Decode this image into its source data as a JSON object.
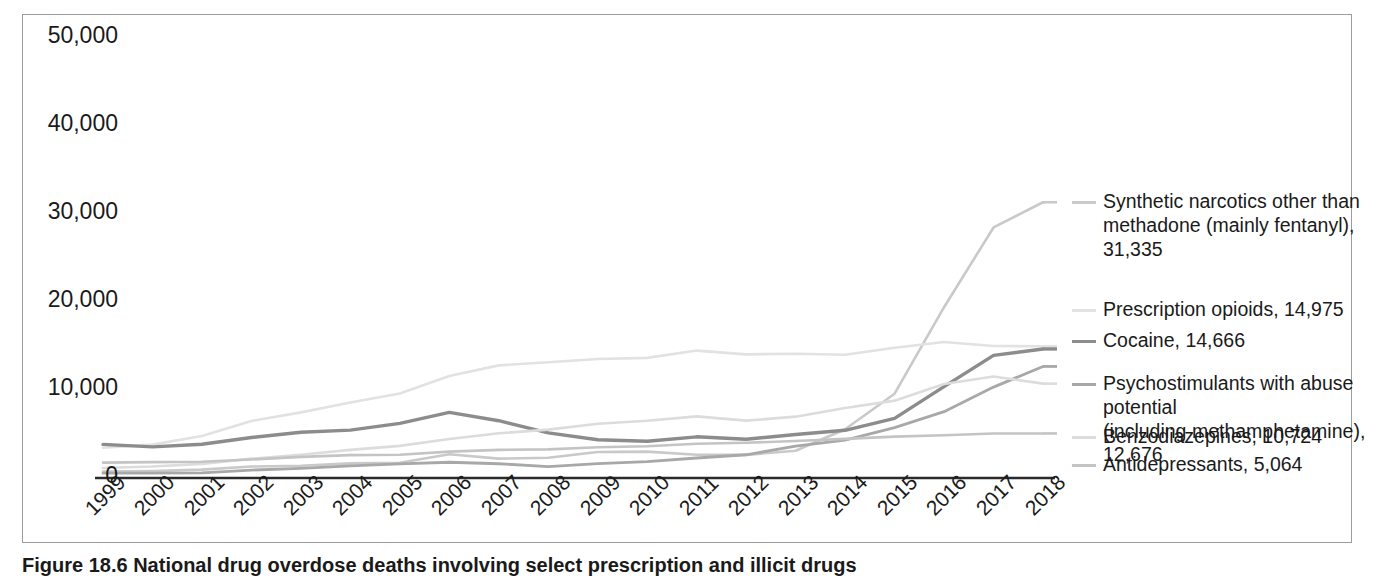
{
  "figure": {
    "caption": "Figure 18.6  National drug overdose deaths involving select prescription and illicit drugs"
  },
  "chart_data": {
    "type": "line",
    "title": "",
    "xlabel": "",
    "ylabel": "",
    "ylim": [
      0,
      50000
    ],
    "y_ticks": [
      "0",
      "10,000",
      "20,000",
      "30,000",
      "40,000",
      "50,000"
    ],
    "y_tick_values": [
      0,
      10000,
      20000,
      30000,
      40000,
      50000
    ],
    "grid": false,
    "legend_position": "right",
    "categories": [
      "1999",
      "2000",
      "2001",
      "2002",
      "2003",
      "2004",
      "2005",
      "2006",
      "2007",
      "2008",
      "2009",
      "2010",
      "2011",
      "2012",
      "2013",
      "2014",
      "2015",
      "2016",
      "2017",
      "2018"
    ],
    "series": [
      {
        "name": "Synthetic narcotics other than methadone (mainly fentanyl)",
        "legend_label": "Synthetic narcotics other than\nmethadone (mainly fentanyl), 31,335",
        "final_value": 31335,
        "color": "#c9c9c9",
        "width": 2.6,
        "values": [
          730,
          780,
          950,
          1300,
          1400,
          1660,
          1740,
          2700,
          2200,
          2300,
          2950,
          3000,
          2650,
          2630,
          3100,
          5540,
          9580,
          19410,
          28470,
          31335
        ]
      },
      {
        "name": "Prescription opioids",
        "legend_label": "Prescription opioids, 14,975",
        "final_value": 14975,
        "color": "#e2e2e2",
        "width": 2.6,
        "values": [
          3440,
          3790,
          4770,
          6480,
          7460,
          8580,
          9610,
          11590,
          12800,
          13150,
          13520,
          13650,
          14480,
          14050,
          14120,
          14000,
          14800,
          15450,
          15000,
          14975
        ]
      },
      {
        "name": "Cocaine",
        "legend_label": "Cocaine, 14,666",
        "final_value": 14666,
        "color": "#8c8c8c",
        "width": 3.4,
        "values": [
          3820,
          3540,
          3830,
          4600,
          5200,
          5440,
          6210,
          7450,
          6510,
          5130,
          4350,
          4180,
          4680,
          4400,
          4940,
          5420,
          6780,
          10380,
          13940,
          14666
        ]
      },
      {
        "name": "Psychostimulants with abuse potential (including methamphetamine)",
        "legend_label": "Psychostimulants with abuse potential\n(including methamphetamine), 12,676",
        "final_value": 12676,
        "color": "#a8a8a8",
        "width": 2.8,
        "values": [
          550,
          560,
          580,
          900,
          1100,
          1380,
          1610,
          1790,
          1620,
          1300,
          1630,
          1850,
          2270,
          2640,
          3630,
          4300,
          5720,
          7540,
          10330,
          12676
        ]
      },
      {
        "name": "Benzodiazepines",
        "legend_label": "Benzodiazepines, 10,724",
        "final_value": 10724,
        "color": "#dcdcdc",
        "width": 2.6,
        "values": [
          1140,
          1300,
          1600,
          2200,
          2640,
          3200,
          3650,
          4430,
          5080,
          5500,
          6160,
          6500,
          7000,
          6520,
          6970,
          7950,
          8790,
          10680,
          11540,
          10724
        ]
      },
      {
        "name": "Antidepressants",
        "legend_label": "Antidepressants, 5,064",
        "final_value": 5064,
        "color": "#c4c4c4",
        "width": 2.6,
        "values": [
          1750,
          1800,
          1850,
          2100,
          2400,
          2600,
          2650,
          3000,
          3200,
          3250,
          3500,
          3600,
          3900,
          4000,
          4200,
          4450,
          4700,
          4850,
          5050,
          5064
        ]
      }
    ]
  },
  "legend": {
    "entries": [
      {
        "label": "Synthetic narcotics other than\nmethadone (mainly fentanyl), 31,335",
        "color": "#c9c9c9",
        "top": 0
      },
      {
        "label": "Prescription opioids, 14,975",
        "color": "#e2e2e2",
        "top": 108
      },
      {
        "label": "Cocaine, 14,666",
        "color": "#8c8c8c",
        "top": 139
      },
      {
        "label": "Psychostimulants with abuse potential\n(including methamphetamine), 12,676",
        "color": "#a8a8a8",
        "top": 182
      },
      {
        "label": "Benzodiazepines, 10,724",
        "color": "#dcdcdc",
        "top": 235
      },
      {
        "label": "Antidepressants, 5,064",
        "color": "#c4c4c4",
        "top": 263
      }
    ]
  }
}
